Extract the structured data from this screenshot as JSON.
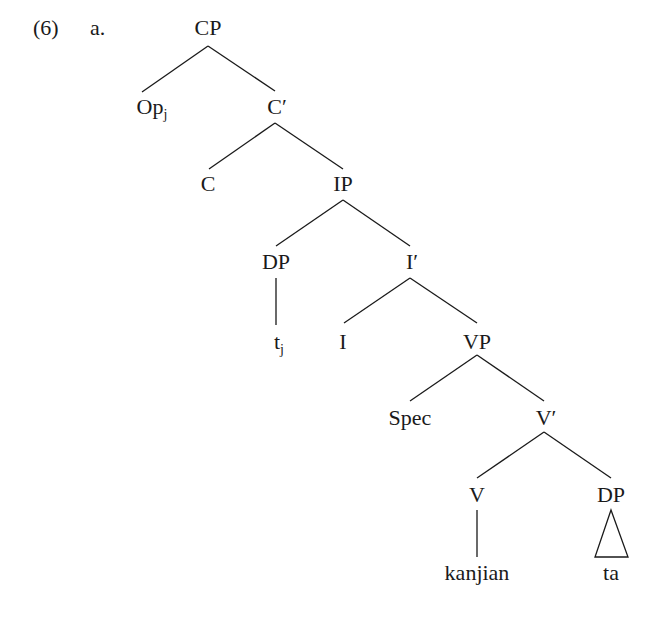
{
  "example": {
    "number": "(6)",
    "sub_label": "a."
  },
  "tree": {
    "nodes": {
      "cp": "CP",
      "op": "Op",
      "op_index": "j",
      "c_bar": "C′",
      "c": "C",
      "ip": "IP",
      "dp_subj": "DP",
      "i_bar": "I′",
      "trace": "t",
      "trace_index": "j",
      "i": "I",
      "vp": "VP",
      "spec": "Spec",
      "v_bar": "V′",
      "v": "V",
      "dp_obj": "DP",
      "verb": "kanjian",
      "object": "ta"
    },
    "edges": [
      [
        "CP",
        "Op_j"
      ],
      [
        "CP",
        "C′"
      ],
      [
        "C′",
        "C"
      ],
      [
        "C′",
        "IP"
      ],
      [
        "IP",
        "DP"
      ],
      [
        "IP",
        "I′"
      ],
      [
        "DP",
        "t_j"
      ],
      [
        "I′",
        "I"
      ],
      [
        "I′",
        "VP"
      ],
      [
        "VP",
        "Spec"
      ],
      [
        "VP",
        "V′"
      ],
      [
        "V′",
        "V"
      ],
      [
        "V′",
        "DP"
      ],
      [
        "V",
        "kanjian"
      ],
      [
        "DP",
        "ta (triangle)"
      ]
    ]
  }
}
